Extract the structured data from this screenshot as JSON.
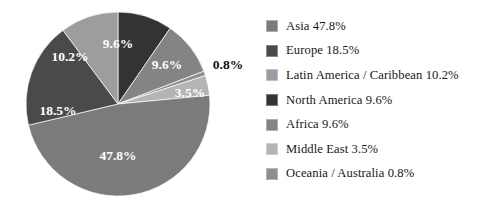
{
  "chart_data": {
    "type": "pie",
    "title": "",
    "categories": [
      "Asia",
      "Europe",
      "Latin America / Caribbean",
      "North America",
      "Africa",
      "Middle East",
      "Oceania / Australia"
    ],
    "values": [
      47.8,
      18.5,
      10.2,
      9.6,
      9.6,
      3.5,
      0.8
    ],
    "value_labels": [
      "47.8%",
      "18.5%",
      "10.2%",
      "9.6%",
      "9.6%",
      "3.5%",
      "0.8%"
    ],
    "unit": "%",
    "legend_position": "right",
    "grid": false,
    "start_angle_deg": 0,
    "direction": "clockwise",
    "draw_order": [
      "North America",
      "Africa",
      "Oceania / Australia",
      "Middle East",
      "Asia",
      "Europe",
      "Latin America / Caribbean"
    ],
    "colors": {
      "Asia": "#7b7b7b",
      "Europe": "#4a4a4a",
      "Latin America / Caribbean": "#9d9d9d",
      "North America": "#333333",
      "Africa": "#848484",
      "Middle East": "#b4b4b4",
      "Oceania / Australia": "#8e8e8e"
    }
  },
  "pie": {
    "center_x": 118,
    "center_y": 104,
    "radius": 92,
    "slices": [
      {
        "name": "North America",
        "label": "9.6%",
        "color": "#333333",
        "start": 0.0,
        "end": 34.56,
        "label_x": 118,
        "label_y": 45,
        "label_class": "slice-label-in"
      },
      {
        "name": "Africa",
        "label": "9.6%",
        "color": "#848484",
        "start": 34.56,
        "end": 69.12,
        "label_x": 167,
        "label_y": 66,
        "label_class": "slice-label-in"
      },
      {
        "name": "Oceania / Australia",
        "label": "0.8%",
        "color": "#8e8e8e",
        "start": 69.12,
        "end": 72.0,
        "label_x": 228,
        "label_y": 66,
        "label_class": "slice-label-out"
      },
      {
        "name": "Middle East",
        "label": "3.5%",
        "color": "#b4b4b4",
        "start": 72.0,
        "end": 84.6,
        "label_x": 190,
        "label_y": 94,
        "label_class": "slice-label-in"
      },
      {
        "name": "Asia",
        "label": "47.8%",
        "color": "#7b7b7b",
        "start": 84.6,
        "end": 256.68,
        "label_x": 118,
        "label_y": 157,
        "label_class": "slice-label-in"
      },
      {
        "name": "Europe",
        "label": "18.5%",
        "color": "#4a4a4a",
        "start": 256.68,
        "end": 323.28,
        "label_x": 58,
        "label_y": 112,
        "label_class": "slice-label-in"
      },
      {
        "name": "Latin America / Caribbean",
        "label": "10.2%",
        "color": "#9d9d9d",
        "start": 323.28,
        "end": 360.0,
        "label_x": 70,
        "label_y": 58,
        "label_class": "slice-label-in"
      }
    ]
  },
  "legend": {
    "items": [
      {
        "label": "Asia 47.8%",
        "color": "#7b7b7b"
      },
      {
        "label": "Europe 18.5%",
        "color": "#4a4a4a"
      },
      {
        "label": "Latin America / Caribbean 10.2%",
        "color": "#9d9d9d"
      },
      {
        "label": "North America 9.6%",
        "color": "#333333"
      },
      {
        "label": "Africa 9.6%",
        "color": "#848484"
      },
      {
        "label": "Middle East 3.5%",
        "color": "#b4b4b4"
      },
      {
        "label": "Oceania / Australia 0.8%",
        "color": "#8e8e8e"
      }
    ]
  }
}
